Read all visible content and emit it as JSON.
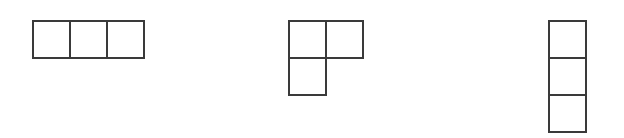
{
  "figure": {
    "canvas": {
      "width": 624,
      "height": 138,
      "background_color": "#ffffff"
    },
    "style": {
      "stroke_color": "#3a3a3a",
      "stroke_width": 1.6,
      "cell_fill": "#ffffff",
      "cell_size": 37
    },
    "shapes": [
      {
        "id": "shape-1",
        "name": "horizontal-i-tromino",
        "label": "I-tromino (horizontal)",
        "cell_count": 3,
        "origin_x": 33,
        "origin_y": 21,
        "cells": [
          {
            "col": 0,
            "row": 0
          },
          {
            "col": 1,
            "row": 0
          },
          {
            "col": 2,
            "row": 0
          }
        ]
      },
      {
        "id": "shape-2",
        "name": "l-tromino",
        "label": "L-tromino",
        "cell_count": 3,
        "origin_x": 289,
        "origin_y": 21,
        "cells": [
          {
            "col": 0,
            "row": 0
          },
          {
            "col": 1,
            "row": 0
          },
          {
            "col": 0,
            "row": 1
          }
        ]
      },
      {
        "id": "shape-3",
        "name": "vertical-i-tromino",
        "label": "I-tromino (vertical)",
        "cell_count": 3,
        "origin_x": 549,
        "origin_y": 21,
        "cells": [
          {
            "col": 0,
            "row": 0
          },
          {
            "col": 0,
            "row": 1
          },
          {
            "col": 0,
            "row": 2
          }
        ]
      }
    ]
  }
}
